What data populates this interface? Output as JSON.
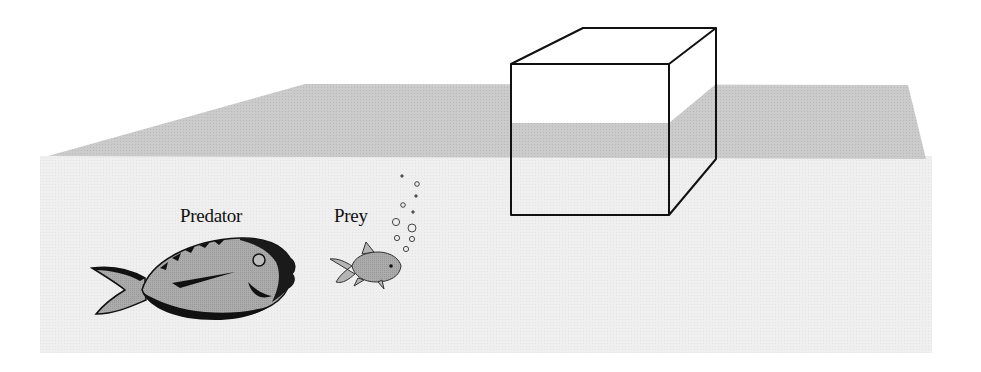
{
  "figure": {
    "labels": {
      "predator": "Predator",
      "prey": "Prey"
    },
    "elements": {
      "water_surface": "water-surface-plane",
      "water_body": "water-body",
      "cube": "cube-object",
      "predator_fish": "predator-fish-icon",
      "prey_fish": "prey-fish-icon",
      "bubbles": "bubbles-icon"
    },
    "colors": {
      "surface": "#c9c9c9",
      "water": "#efefef",
      "fish_body": "#a9a9a9",
      "outline": "#111111",
      "background": "#ffffff"
    }
  }
}
